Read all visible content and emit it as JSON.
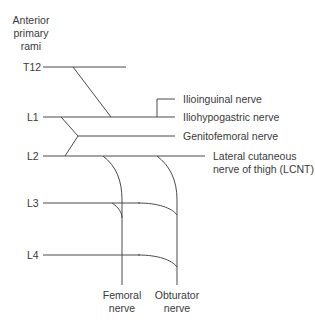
{
  "diagram": {
    "title_lines": [
      "Anterior",
      "primary",
      "rami"
    ],
    "levels": {
      "t12": "T12",
      "l1": "L1",
      "l2": "L2",
      "l3": "L3",
      "l4": "L4"
    },
    "nerves": {
      "ilioinguinal": "Ilioinguinal nerve",
      "iliohypogastric": "Iliohypogastric nerve",
      "genitofemoral": "Genitofemoral nerve",
      "lcnt_line1": "Lateral cutaneous",
      "lcnt_line2": "nerve of thigh (LCNT)",
      "femoral_line1": "Femoral",
      "femoral_line2": "nerve",
      "obturator_line1": "Obturator",
      "obturator_line2": "nerve"
    },
    "line_color": "#4a4a4a",
    "text_color": "#3a3a3a"
  }
}
